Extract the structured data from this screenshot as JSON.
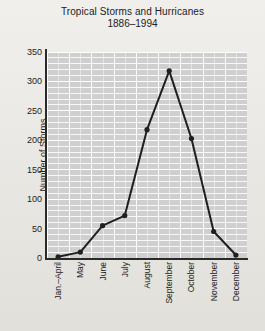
{
  "chart_data": {
    "type": "line",
    "title": "Tropical Storms and Hurricanes",
    "subtitle": "1886–1994",
    "xlabel": "",
    "ylabel": "Number of Storms",
    "categories": [
      "Jan.–April",
      "May",
      "June",
      "July",
      "August",
      "September",
      "October",
      "November",
      "December"
    ],
    "values": [
      2,
      10,
      55,
      72,
      218,
      318,
      203,
      45,
      5
    ],
    "series": [
      {
        "name": "Number of Storms",
        "values": [
          2,
          10,
          55,
          72,
          218,
          318,
          203,
          45,
          5
        ]
      }
    ],
    "ylim": [
      0,
      350
    ],
    "ytick_values": [
      0,
      50,
      100,
      150,
      200,
      250,
      300,
      350
    ],
    "ytick_labels": [
      "0",
      "50",
      "100",
      "150",
      "200",
      "250",
      "300",
      "350"
    ],
    "minor_tick_step": 10,
    "grid": true,
    "grid_color": "#ffffff",
    "plot_background": "#cfcfcf",
    "page_background": "#e9e7e2",
    "line_color": "#1f1f1f",
    "marker": "circle",
    "legend": null,
    "legend_position": "none"
  }
}
